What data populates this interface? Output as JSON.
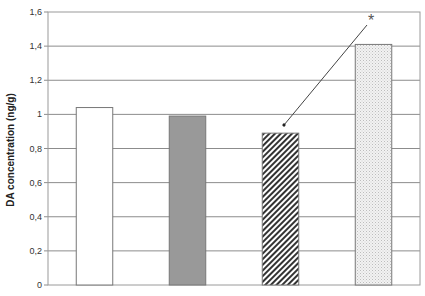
{
  "chart_data": {
    "type": "bar",
    "title": "",
    "xlabel": "",
    "ylabel": "DA concentration (ng/g)",
    "ylim": [
      0,
      1.6
    ],
    "yticks": [
      "0",
      "0,2",
      "0,4",
      "0,6",
      "0,8",
      "1",
      "1,2",
      "1,4",
      "1,6"
    ],
    "grid": true,
    "legend": null,
    "categories": [
      "Group 1",
      "Group 2",
      "Group 3",
      "Group 4"
    ],
    "values": [
      1.04,
      0.99,
      0.89,
      1.41
    ],
    "bar_styles": [
      {
        "fill": "#ffffff",
        "pattern": "none"
      },
      {
        "fill": "#999999",
        "pattern": "solid"
      },
      {
        "fill": "#333333",
        "pattern": "diagonal-hatch"
      },
      {
        "fill": "#e6e6e6",
        "pattern": "dots"
      }
    ],
    "annotations": [
      {
        "text": "*",
        "target_bar": 3,
        "arrow_to_bar": 2,
        "description": "Asterisk with arrow pointing to third bar"
      }
    ]
  },
  "labels": {
    "ylabel": "DA concentration (ng/g)",
    "asterisk": "*"
  }
}
